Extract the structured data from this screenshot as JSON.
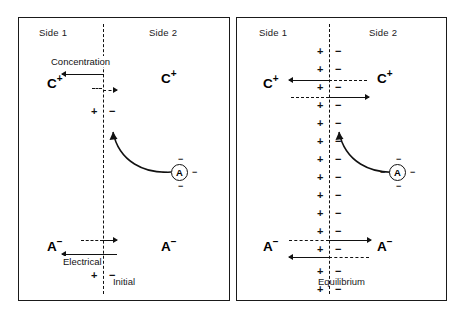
{
  "figure": {
    "type": "diagram",
    "colors": {
      "ink": "#111111",
      "border": "#1a1a1a",
      "background": "#ffffff"
    }
  },
  "panels": [
    {
      "id": "initial",
      "caption": "Initial",
      "side1_label": "Side 1",
      "side2_label": "Side 2",
      "cation_left": "C",
      "cation_left_charge": "+",
      "cation_right": "C",
      "cation_right_charge": "+",
      "anion_left": "A",
      "anion_left_charge": "−",
      "anion_right": "A",
      "anion_right_charge": "−",
      "ion_circle_label": "A",
      "ion_circle_charge": "−",
      "force_upper": "Concentration",
      "force_lower": "Electrical",
      "charge_pairs": [
        {
          "plus": "+",
          "minus": "−",
          "y": 88
        },
        {
          "plus": "+",
          "minus": "−",
          "y": 252
        }
      ],
      "membrane_charge_count": 2
    },
    {
      "id": "equilibrium",
      "caption": "Equilibrium",
      "side1_label": "Side 1",
      "side2_label": "Side 2",
      "cation_left": "C",
      "cation_left_charge": "+",
      "cation_right": "C",
      "cation_right_charge": "+",
      "anion_left": "A",
      "anion_left_charge": "−",
      "anion_right": "A",
      "anion_right_charge": "−",
      "ion_circle_label": "A",
      "ion_circle_charge": "−",
      "charge_pairs": [
        {
          "plus": "+",
          "minus": "−",
          "y": 28
        },
        {
          "plus": "+",
          "minus": "−",
          "y": 46
        },
        {
          "plus": "+",
          "minus": "−",
          "y": 64
        },
        {
          "plus": "+",
          "minus": "−",
          "y": 82
        },
        {
          "plus": "+",
          "minus": "−",
          "y": 100
        },
        {
          "plus": "+",
          "minus": "−",
          "y": 118
        },
        {
          "plus": "+",
          "minus": "−",
          "y": 136
        },
        {
          "plus": "+",
          "minus": "−",
          "y": 154
        },
        {
          "plus": "+",
          "minus": "−",
          "y": 172
        },
        {
          "plus": "+",
          "minus": "−",
          "y": 190
        },
        {
          "plus": "+",
          "minus": "−",
          "y": 208
        },
        {
          "plus": "+",
          "minus": "−",
          "y": 226
        },
        {
          "plus": "+",
          "minus": "−",
          "y": 248
        },
        {
          "plus": "+",
          "minus": "−",
          "y": 266
        }
      ],
      "membrane_charge_count": 14
    }
  ],
  "ion_satellites": {
    "minus": "−"
  }
}
